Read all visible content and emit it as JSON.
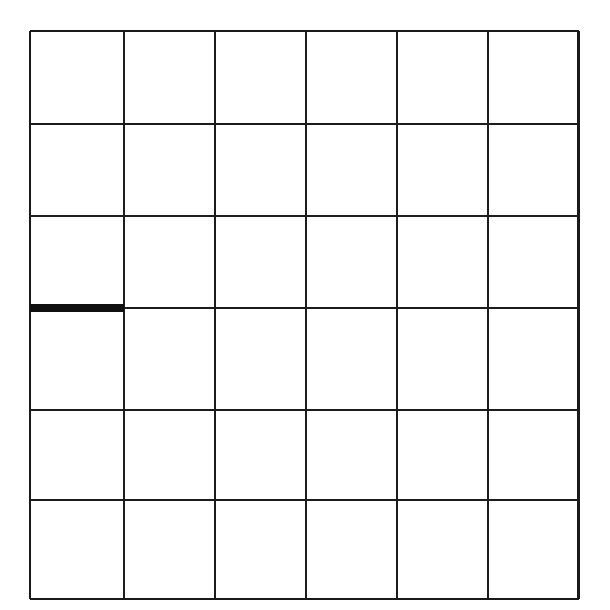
{
  "figure": {
    "type": "line-grid-diagram",
    "background_color": "#ffffff",
    "line_color": "#1c1c1c",
    "highlight_color": "#101010",
    "canvas_width": 610,
    "canvas_height": 610
  },
  "grid": {
    "rows": 6,
    "columns": 6,
    "cell_count": 36,
    "origin_x": 30,
    "origin_y": 31,
    "cell_width": 91.4,
    "cell_height": 94.6,
    "line_width": 2.4,
    "outer_line_width": 2.8,
    "x_positions": [
      30,
      123.8,
      215.0,
      306.0,
      397.0,
      488.0,
      578.5
    ],
    "y_positions": [
      31,
      124.0,
      216.0,
      308.0,
      410.0,
      500.0,
      599.0
    ],
    "column_labels": [
      "1",
      "2",
      "3",
      "4",
      "5",
      "6"
    ],
    "row_labels": [
      "1",
      "2",
      "3",
      "4",
      "5",
      "6"
    ]
  },
  "highlight": {
    "label": "bold-segment",
    "description": "Thick black horizontal segment on left edge between row 3 and row 4",
    "orientation": "horizontal",
    "row_boundary_index": 3,
    "column_index": 1,
    "x_start": 30,
    "x_end": 124,
    "y": 308,
    "thickness": 8,
    "color": "#101010"
  },
  "cells": [
    {
      "row": 1,
      "col": 1
    },
    {
      "row": 1,
      "col": 2
    },
    {
      "row": 1,
      "col": 3
    },
    {
      "row": 1,
      "col": 4
    },
    {
      "row": 1,
      "col": 5
    },
    {
      "row": 1,
      "col": 6
    },
    {
      "row": 2,
      "col": 1
    },
    {
      "row": 2,
      "col": 2
    },
    {
      "row": 2,
      "col": 3
    },
    {
      "row": 2,
      "col": 4
    },
    {
      "row": 2,
      "col": 5
    },
    {
      "row": 2,
      "col": 6
    },
    {
      "row": 3,
      "col": 1
    },
    {
      "row": 3,
      "col": 2
    },
    {
      "row": 3,
      "col": 3
    },
    {
      "row": 3,
      "col": 4
    },
    {
      "row": 3,
      "col": 5
    },
    {
      "row": 3,
      "col": 6
    },
    {
      "row": 4,
      "col": 1
    },
    {
      "row": 4,
      "col": 2
    },
    {
      "row": 4,
      "col": 3
    },
    {
      "row": 4,
      "col": 4
    },
    {
      "row": 4,
      "col": 5
    },
    {
      "row": 4,
      "col": 6
    },
    {
      "row": 5,
      "col": 1
    },
    {
      "row": 5,
      "col": 2
    },
    {
      "row": 5,
      "col": 3
    },
    {
      "row": 5,
      "col": 4
    },
    {
      "row": 5,
      "col": 5
    },
    {
      "row": 5,
      "col": 6
    },
    {
      "row": 6,
      "col": 1
    },
    {
      "row": 6,
      "col": 2
    },
    {
      "row": 6,
      "col": 3
    },
    {
      "row": 6,
      "col": 4
    },
    {
      "row": 6,
      "col": 5
    },
    {
      "row": 6,
      "col": 6
    }
  ]
}
